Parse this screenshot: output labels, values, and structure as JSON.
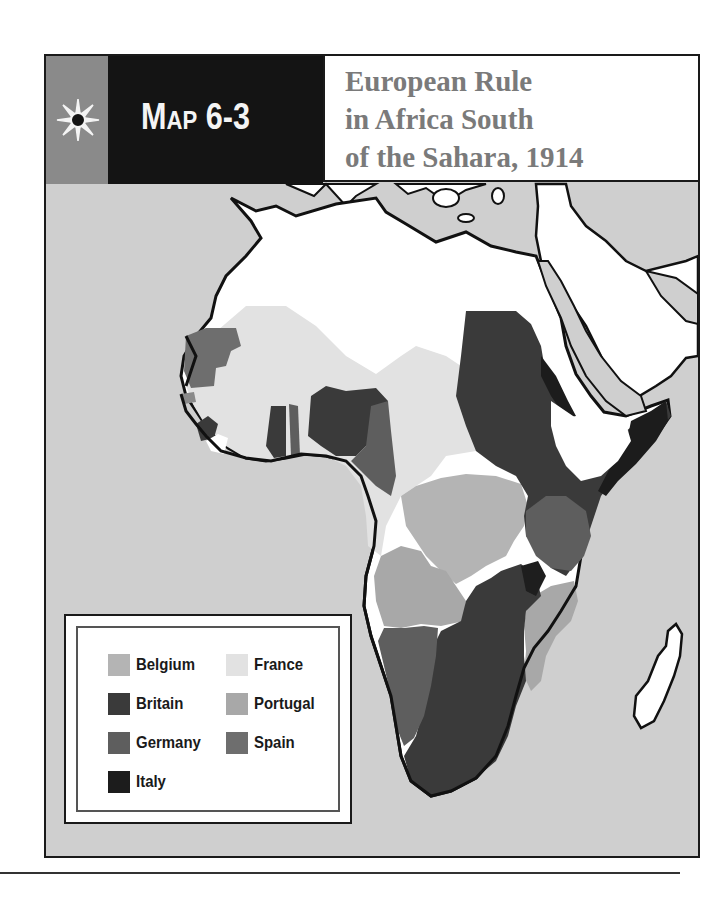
{
  "header": {
    "map_number_prefix": "M",
    "map_number_small": "AP",
    "map_number_suffix": " 6-3",
    "title_lines": [
      "European Rule",
      "in Africa South",
      "of the Sahara, 1914"
    ]
  },
  "icons": {
    "header_icon": "sun-compass-icon"
  },
  "legend": {
    "items": [
      {
        "label": "Belgium",
        "color": "#b4b4b4"
      },
      {
        "label": "France",
        "color": "#e2e2e2"
      },
      {
        "label": "Britain",
        "color": "#3a3a3a"
      },
      {
        "label": "Portugal",
        "color": "#a8a8a8"
      },
      {
        "label": "Germany",
        "color": "#5e5e5e"
      },
      {
        "label": "Spain",
        "color": "#6e6e6e"
      },
      {
        "label": "Italy",
        "color": "#1c1c1c"
      }
    ]
  },
  "colors": {
    "ocean": "#cfcfcf",
    "independent": "#ffffff",
    "header_black": "#141414",
    "header_grey": "#8a8a8a",
    "title_text": "#7a7a7a"
  }
}
